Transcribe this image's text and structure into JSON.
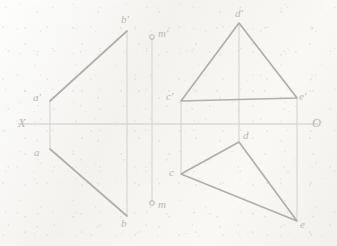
{
  "drawing": {
    "title": "Orthographic projection exercise",
    "canvas": {
      "width": 337,
      "height": 246,
      "background": "#f6f5f2"
    },
    "colors": {
      "object_line": "#b0afab",
      "construction_line": "#cfcecb",
      "axis_line": "#c6c5c1",
      "label_text": "#b9b8b4",
      "paper": "#f6f5f2"
    },
    "axis": {
      "x_label": "X",
      "origin_label": "O",
      "y_line_top": 18,
      "y_line_bottom": 232,
      "horizontal_y": 124,
      "horizontal_x_start": 18,
      "horizontal_x_end": 318
    },
    "labels": {
      "a_prime": "a'",
      "b_prime": "b'",
      "a": "a",
      "b": "b",
      "m_prime": "m'",
      "m": "m",
      "c_prime": "c'",
      "d_prime": "d'",
      "e_prime": "e'",
      "c": "c",
      "d": "d",
      "e": "e",
      "x_axis": "X",
      "origin": "O"
    },
    "points": {
      "a_prime": {
        "x": 50,
        "y": 101,
        "label": "a'",
        "label_x": 34,
        "label_y": 93
      },
      "b_prime": {
        "x": 127,
        "y": 31,
        "label": "b'",
        "label_x": 123,
        "label_y": 16
      },
      "a": {
        "x": 50,
        "y": 149,
        "label": "a",
        "label_x": 34,
        "label_y": 148
      },
      "b": {
        "x": 127,
        "y": 216,
        "label": "b",
        "label_x": 122,
        "label_y": 219
      },
      "m_prime": {
        "x": 152,
        "y": 37,
        "label": "m'",
        "label_x": 157,
        "label_y": 29
      },
      "m": {
        "x": 152,
        "y": 203,
        "label": "m",
        "label_x": 157,
        "label_y": 203
      },
      "c_prime": {
        "x": 181,
        "y": 101,
        "label": "c'",
        "label_x": 167,
        "label_y": 92
      },
      "d_prime": {
        "x": 239,
        "y": 23,
        "label": "d'",
        "label_x": 236,
        "label_y": 9
      },
      "e_prime": {
        "x": 297,
        "y": 98,
        "label": "e'",
        "label_x": 300,
        "label_y": 92
      },
      "c": {
        "x": 181,
        "y": 174,
        "label": "c",
        "label_x": 170,
        "label_y": 170
      },
      "d": {
        "x": 239,
        "y": 142,
        "label": "d",
        "label_x": 243,
        "label_y": 131
      },
      "e": {
        "x": 297,
        "y": 221,
        "label": "e",
        "label_x": 300,
        "label_y": 222
      }
    },
    "shapes": [
      {
        "name": "triangle-abm-front-upper",
        "type": "polyline",
        "points": "50,101 127,31"
      },
      {
        "name": "triangle-abm-top-lower",
        "type": "polyline",
        "points": "50,149 127,216"
      },
      {
        "name": "triangle-cde-front",
        "type": "polygon",
        "points": "181,101 239,23 297,98"
      },
      {
        "name": "triangle-cde-top",
        "type": "polygon",
        "points": "181,174 239,142 297,221"
      }
    ],
    "construction_lines": [
      {
        "name": "vline-a",
        "x": 50,
        "y1": 101,
        "y2": 149
      },
      {
        "name": "vline-b",
        "x": 127,
        "y1": 31,
        "y2": 216
      },
      {
        "name": "vline-m",
        "x": 152,
        "y1": 37,
        "y2": 203
      },
      {
        "name": "vline-c",
        "x": 181,
        "y1": 101,
        "y2": 174
      },
      {
        "name": "vline-d",
        "x": 239,
        "y1": 23,
        "y2": 142
      },
      {
        "name": "vline-e",
        "x": 297,
        "y1": 98,
        "y2": 221
      }
    ]
  }
}
